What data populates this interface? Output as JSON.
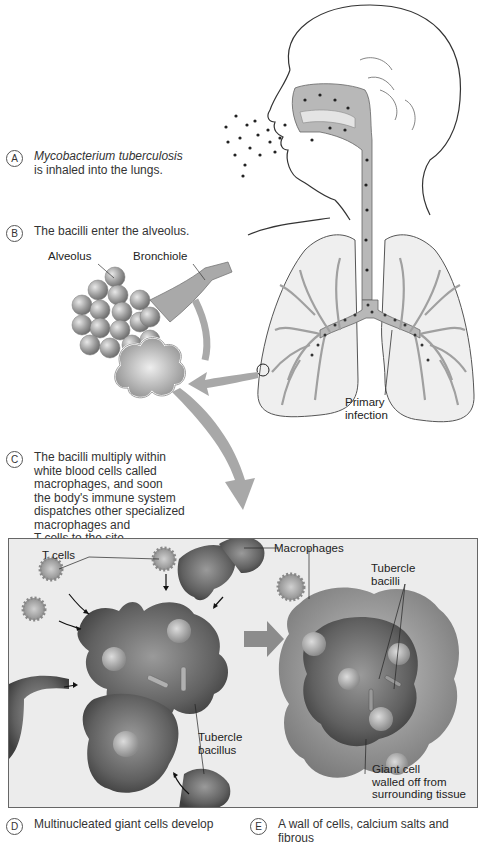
{
  "figure": {
    "steps": [
      {
        "id": "A",
        "text_italic": "Mycobacterium tuberculosis",
        "text": "is inhaled into the lungs."
      },
      {
        "id": "B",
        "text": "The bacilli enter the alveolus."
      },
      {
        "id": "C",
        "text": "The bacilli multiply within\nwhite blood cells called\nmacrophages, and soon\nthe body's immune system\ndispatches other specialized\nmacrophages and\nT cells to the site."
      },
      {
        "id": "D",
        "text": "Multinucleated giant cells develop"
      },
      {
        "id": "E",
        "text": "A wall of cells, calcium salts and fibrous"
      }
    ],
    "labels": {
      "alveolus": "Alveolus",
      "bronchiole": "Bronchiole",
      "primary_infection": "Primary\ninfection",
      "t_cells": "T cells",
      "macrophages": "Macrophages",
      "tubercle_bacilli": "Tubercle\nbacilli",
      "tubercle_bacillus": "Tubercle\nbacillus",
      "giant_cell": "Giant cell\nwalled off from\nsurrounding tissue"
    },
    "colors": {
      "airway_fill": "#b8b8b8",
      "lung_fill": "#efefef",
      "panel_bg": "#ececec",
      "cell_dark": "#555555",
      "arrow_gray": "#a8a8a8"
    }
  }
}
